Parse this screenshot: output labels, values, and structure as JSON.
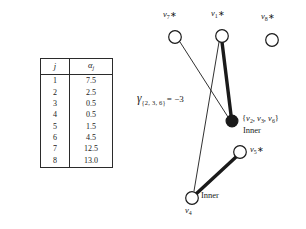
{
  "figure": {
    "table": {
      "headers": [
        "j",
        "α"
      ],
      "header_j": "j",
      "header_alpha_base": "α",
      "header_alpha_sub": "j",
      "rows": [
        {
          "j": "1",
          "alpha": "7.5"
        },
        {
          "j": "2",
          "alpha": "2.5"
        },
        {
          "j": "3",
          "alpha": "0.5"
        },
        {
          "j": "4",
          "alpha": "0.5"
        },
        {
          "j": "5",
          "alpha": "1.5"
        },
        {
          "j": "6",
          "alpha": "4.5"
        },
        {
          "j": "7",
          "alpha": "12.5"
        },
        {
          "j": "8",
          "alpha": "13.0"
        }
      ]
    },
    "gamma": {
      "symbol": "γ",
      "subscript": "{2, 3, 6}",
      "equals": "= −3"
    },
    "graph": {
      "nodes": [
        {
          "id": "v7",
          "label_base": "v",
          "label_sub": "7",
          "star": "∗",
          "filled": false,
          "cx": 175,
          "cy": 37,
          "r": 6.5,
          "label_x": 163,
          "label_y": 10
        },
        {
          "id": "v1",
          "label_base": "v",
          "label_sub": "1",
          "star": "∗",
          "filled": false,
          "cx": 222,
          "cy": 36,
          "r": 6.5,
          "label_x": 211,
          "label_y": 9
        },
        {
          "id": "v8",
          "label_base": "v",
          "label_sub": "8",
          "star": "∗",
          "filled": false,
          "cx": 272,
          "cy": 40,
          "r": 6.5,
          "label_x": 261,
          "label_y": 12
        },
        {
          "id": "inner236",
          "label_base": "",
          "label_sub": "",
          "star": "",
          "filled": true,
          "cx": 232,
          "cy": 121,
          "r": 6.0,
          "label_x": 0,
          "label_y": 0
        },
        {
          "id": "v5",
          "label_base": "v",
          "label_sub": "5",
          "star": "∗",
          "filled": false,
          "cx": 240,
          "cy": 152,
          "r": 6.5,
          "label_x": 250,
          "label_y": 145
        },
        {
          "id": "v4",
          "label_base": "v",
          "label_sub": "4",
          "star": "",
          "filled": false,
          "cx": 192,
          "cy": 198,
          "r": 6.5,
          "label_x": 185,
          "label_y": 207
        }
      ],
      "edges": [
        {
          "from": "v7",
          "to": "inner236",
          "weight": "thin"
        },
        {
          "from": "v1",
          "to": "inner236",
          "weight": "thick"
        },
        {
          "from": "v1",
          "to": "v4",
          "weight": "thin"
        },
        {
          "from": "v4",
          "to": "v5",
          "weight": "thick"
        }
      ],
      "inner_set_label": {
        "open": "{",
        "v2": "v",
        "v2_sub": "2",
        "v3": "v",
        "v3_sub": "3",
        "v6": "v",
        "v6_sub": "6",
        "close": "}",
        "text": "{v2, v3, v6}",
        "x": 242,
        "y": 115
      },
      "inner_caption_1": {
        "text": "Inner",
        "x": 243,
        "y": 127
      },
      "inner_caption_2": {
        "text": "Inner",
        "x": 201,
        "y": 192
      }
    }
  }
}
